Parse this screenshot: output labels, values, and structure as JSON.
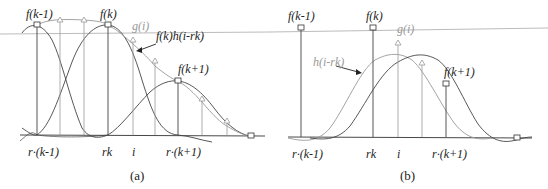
{
  "figure": {
    "panel_a": {
      "caption": "(a)",
      "labels": {
        "f_km1": "f(k-1)",
        "f_k": "f(k)",
        "f_kp1": "f(k+1)",
        "g_i": "g(i)",
        "fk_h": "f(k)h(i-rk)",
        "x_rkm1": "r·(k-1)",
        "x_rk": "rk",
        "x_i": "i",
        "x_rkp1": "r·(k+1)"
      }
    },
    "panel_b": {
      "caption": "(b)",
      "labels": {
        "f_km1": "f(k-1)",
        "f_k": "f(k)",
        "f_kp1": "f(k+1)",
        "g_i": "g(i)",
        "h": "h(i-rk)",
        "x_rkm1": "r·(k-1)",
        "x_rk": "rk",
        "x_i": "i",
        "x_rkp1": "r·(k+1)"
      }
    },
    "colors": {
      "line": "#333333",
      "gray": "#9a9a9a",
      "light": "#b5b5b5"
    }
  }
}
